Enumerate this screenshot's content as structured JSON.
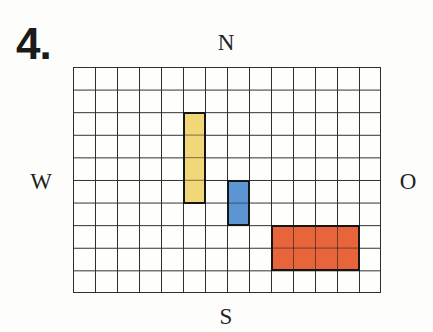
{
  "title": {
    "number": "4."
  },
  "compass": {
    "north": "N",
    "south": "S",
    "west": "W",
    "east": "O"
  },
  "grid": {
    "columns": 14,
    "rows": 10,
    "line_color": "#2e2e2e",
    "background": "#fefefd"
  },
  "blocks": [
    {
      "id": "yellow",
      "color": "#f0d878",
      "col": 5,
      "row": 2,
      "width": 1,
      "height": 4
    },
    {
      "id": "blue",
      "color": "#5b96d2",
      "col": 7,
      "row": 5,
      "width": 1,
      "height": 2
    },
    {
      "id": "red",
      "color": "#e8643a",
      "col": 9,
      "row": 7,
      "width": 4,
      "height": 2
    }
  ]
}
